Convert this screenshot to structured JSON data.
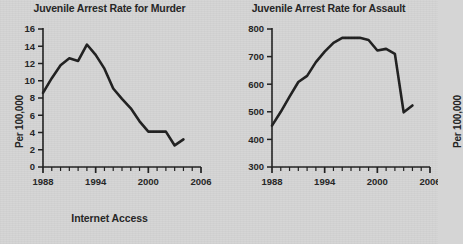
{
  "figure": {
    "background_color": "#d5d5d5",
    "ink_color": "#1f1f1f",
    "xlabel": "Internet Access"
  },
  "chart_data": [
    {
      "type": "line",
      "title": "Juvenile Arrest Rate for Murder",
      "xlabel": "Internet Access",
      "ylabel": "Per 100,000",
      "xlim": [
        1988,
        2006
      ],
      "ylim": [
        0,
        16
      ],
      "xticks": [
        1988,
        1994,
        2000,
        2006
      ],
      "xtick_labels": [
        "1988",
        "1994",
        "2000",
        "2006"
      ],
      "minor_xtick_step": 1,
      "yticks": [
        0,
        2,
        4,
        6,
        8,
        10,
        12,
        14,
        16
      ],
      "ytick_labels": [
        "0",
        "2",
        "4",
        "6",
        "8",
        "10",
        "12",
        "14",
        "16"
      ],
      "grid": false,
      "legend": null,
      "x": [
        1988,
        1989,
        1990,
        1991,
        1992,
        1993,
        1994,
        1995,
        1996,
        1997,
        1998,
        1999,
        2000,
        2001,
        2002,
        2003,
        2004
      ],
      "values": [
        8.6,
        10.3,
        11.8,
        12.6,
        12.3,
        14.2,
        13.0,
        11.4,
        9.1,
        7.9,
        6.8,
        5.3,
        4.1,
        4.1,
        4.1,
        2.5,
        3.2
      ],
      "series": [
        {
          "name": "Juvenile arrest rate for murder",
          "values": [
            8.6,
            10.3,
            11.8,
            12.6,
            12.3,
            14.2,
            13.0,
            11.4,
            9.1,
            7.9,
            6.8,
            5.3,
            4.1,
            4.1,
            4.1,
            2.5,
            3.2
          ]
        }
      ]
    },
    {
      "type": "line",
      "title": "Juvenile Arrest Rate for Assault",
      "xlabel": "Internet Access",
      "ylabel": "Per 100,000",
      "xlim": [
        1988,
        2006
      ],
      "ylim": [
        300,
        800
      ],
      "xticks": [
        1988,
        1994,
        2000,
        2006
      ],
      "xtick_labels": [
        "1988",
        "1994",
        "2000",
        "2006"
      ],
      "minor_xtick_step": 1,
      "yticks": [
        300,
        400,
        500,
        600,
        700,
        800
      ],
      "ytick_labels": [
        "300",
        "400",
        "500",
        "600",
        "700",
        "800"
      ],
      "grid": false,
      "legend": null,
      "x": [
        1988,
        1989,
        1990,
        1991,
        1992,
        1993,
        1994,
        1995,
        1996,
        1997,
        1998,
        1999,
        2000,
        2001,
        2002,
        2003,
        2004
      ],
      "values": [
        450,
        500,
        555,
        608,
        630,
        680,
        718,
        750,
        768,
        768,
        768,
        760,
        722,
        728,
        710,
        498,
        523
      ],
      "series": [
        {
          "name": "Juvenile arrest rate for assault",
          "values": [
            450,
            500,
            555,
            608,
            630,
            680,
            718,
            750,
            768,
            768,
            768,
            760,
            722,
            728,
            710,
            498,
            523
          ]
        }
      ]
    }
  ]
}
